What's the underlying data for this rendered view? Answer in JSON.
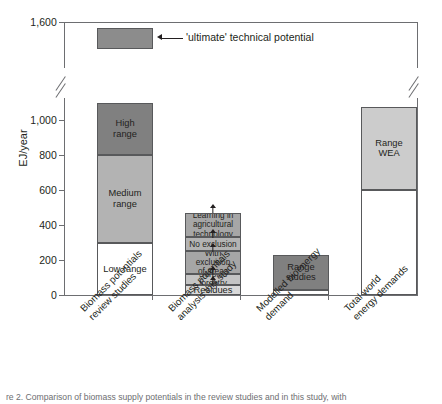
{
  "figure": {
    "ylabel": "EJ/year",
    "caption": "re 2. Comparison of biomass supply potentials in the review studies and in this study, with",
    "annotation": "'ultimate' technical potential"
  },
  "chart_data": {
    "type": "bar",
    "title": "",
    "xlabel": "",
    "ylabel": "EJ/year",
    "ylim": [
      0,
      1600
    ],
    "yticks": [
      0,
      200,
      400,
      600,
      800,
      1000,
      1600
    ],
    "ytick_labels": [
      "0",
      "200",
      "400",
      "600",
      "800",
      "1,000",
      "1,600"
    ],
    "axis_break": {
      "from": 1100,
      "to": 1450,
      "note": "y-axis broken between 1,000 and 1,600"
    },
    "grid": false,
    "legend": "none",
    "stacked": true,
    "categories": [
      "Biomass potentials review studies",
      "Biomass potentials analysis this study",
      "Modelled bioenergy demand",
      "Total world energy demands"
    ],
    "bars": [
      {
        "category": "Biomass potentials review studies",
        "segments": [
          {
            "label": "Low range",
            "from": 0,
            "to": 300,
            "color": "#ffffff",
            "arrow": false
          },
          {
            "label": "Medium range",
            "from": 300,
            "to": 800,
            "color": "#b3b3b3",
            "arrow": false
          },
          {
            "label": "High range",
            "from": 800,
            "to": 1100,
            "color": "#808080",
            "arrow": false
          }
        ],
        "floating": {
          "label": "",
          "from": 1490,
          "to": 1580,
          "color": "#8c8c8c"
        }
      },
      {
        "category": "Biomass potentials analysis this study",
        "segments": [
          {
            "label": "Residues",
            "from": 0,
            "to": 60,
            "color": "#d9d9d9",
            "arrow": true
          },
          {
            "label": "Surplus forestry",
            "from": 60,
            "to": 120,
            "color": "#c4c4c4",
            "arrow": true
          },
          {
            "label": "With exclusion of areas",
            "from": 120,
            "to": 250,
            "color": "#a6a6a6",
            "arrow": true
          },
          {
            "label": "No exclusion",
            "from": 250,
            "to": 330,
            "color": "#b3b3b3",
            "arrow": true
          },
          {
            "label": "Learning in agricultural technology",
            "from": 330,
            "to": 470,
            "color": "#a6a6a6",
            "arrow": true
          }
        ]
      },
      {
        "category": "Modelled bioenergy demand",
        "segments": [
          {
            "label": "",
            "from": 0,
            "to": 30,
            "color": "#ffffff",
            "arrow": false
          },
          {
            "label": "Range studies",
            "from": 30,
            "to": 230,
            "color": "#808080",
            "arrow": false
          }
        ]
      },
      {
        "category": "Total world energy demands",
        "segments": [
          {
            "label": "",
            "from": 0,
            "to": 600,
            "color": "#ffffff",
            "arrow": false
          },
          {
            "label": "Range WEA",
            "from": 600,
            "to": 1075,
            "color": "#cccccc",
            "arrow": false
          }
        ]
      }
    ],
    "annotations": [
      {
        "text": "'ultimate' technical potential",
        "points_to": "Biomass potentials review studies floating box",
        "value": 1535
      }
    ]
  },
  "ticks": {
    "t0": "0",
    "t200": "200",
    "t400": "400",
    "t600": "600",
    "t800": "800",
    "t1000": "1,000",
    "t1600": "1,600"
  },
  "xlabels": {
    "b1l1": "Biomass potentials",
    "b1l2": "review studies",
    "b2l1": "Biomass potentials",
    "b2l2": "analysis this study",
    "b3l1": "Modelled bioenergy",
    "b3l2": "demand",
    "b4l1": "Total world",
    "b4l2": "energy demands"
  },
  "segments": {
    "s1_low": "Low range",
    "s1_medium": "Medium\nrange",
    "s1_high": "High\nrange",
    "s2_res": "Residues",
    "s2_forest": "Surplus forestry",
    "s2_excl": "With exclusion\nof areas",
    "s2_noexcl": "No exclusion",
    "s2_learn": "Learning in\nagricultural\ntechnology",
    "s3_range": "Range\nstudies",
    "s4_wea": "Range\nWEA"
  }
}
